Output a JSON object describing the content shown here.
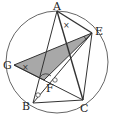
{
  "diagram": {
    "type": "circle-geometry",
    "circle": {
      "cx": 57,
      "cy": 62,
      "r": 51
    },
    "points": {
      "A": {
        "label": "A",
        "x": 57,
        "y": 11
      },
      "E": {
        "label": "E",
        "x": 92,
        "y": 33
      },
      "G": {
        "label": "G",
        "x": 14,
        "y": 65
      },
      "B": {
        "label": "B",
        "x": 33,
        "y": 103
      },
      "C": {
        "label": "C",
        "x": 83,
        "y": 100
      },
      "F": {
        "label": "F",
        "x": 44,
        "y": 80
      }
    },
    "shaded_triangle": [
      "G",
      "E",
      "F"
    ],
    "segments": [
      [
        "A",
        "B"
      ],
      [
        "A",
        "C"
      ],
      [
        "A",
        "E"
      ],
      [
        "E",
        "C"
      ],
      [
        "B",
        "C"
      ],
      [
        "G",
        "E"
      ],
      [
        "E",
        "B"
      ],
      [
        "G",
        "C"
      ]
    ],
    "marks": {
      "angle_x_at_A": "×",
      "angle_x_at_G": "×",
      "angle_arc_at_E": "arc",
      "angle_arc_at_F": "arc",
      "circle_marks_on_BE": "o"
    },
    "colors": {
      "shade": "#a8a8a8",
      "line": "#333333",
      "circle": "#555555"
    }
  }
}
